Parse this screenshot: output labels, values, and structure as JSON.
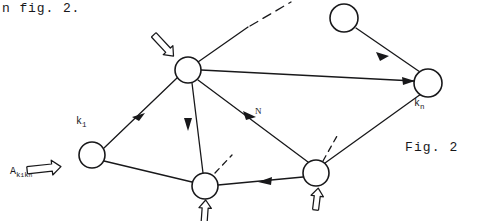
{
  "page": {
    "width": 477,
    "height": 221,
    "background": "#ffffff",
    "ink_color": "#18181a"
  },
  "text": {
    "top_caption": "n fig. 2.",
    "figure_caption": "Fig. 2",
    "node_label_k1": "k",
    "node_label_k1_sub": "1",
    "node_label_kn": "k",
    "node_label_kn_sub": "n",
    "edge_label_N": "N",
    "operator_label_A": "A",
    "operator_label_A_sub_k": "k",
    "operator_label_A_sub_k_1": "1",
    "operator_label_A_sub_k2": "k",
    "operator_label_A_sub_k2_n": "n"
  },
  "diagram": {
    "type": "directed-graph",
    "nodes": [
      {
        "id": "top",
        "name": "top-node",
        "cx": 188,
        "cy": 70,
        "r": 13,
        "label": ""
      },
      {
        "id": "k1",
        "name": "node-k1",
        "cx": 92,
        "cy": 155,
        "r": 13,
        "label": "k1"
      },
      {
        "id": "bl",
        "name": "bottom-left-node",
        "cx": 205,
        "cy": 186,
        "r": 13,
        "label": ""
      },
      {
        "id": "br",
        "name": "bottom-right-node",
        "cx": 316,
        "cy": 173,
        "r": 13,
        "label": ""
      },
      {
        "id": "tr",
        "name": "top-right-node",
        "cx": 344,
        "cy": 18,
        "r": 14,
        "label": ""
      },
      {
        "id": "kn",
        "name": "node-kn",
        "cx": 428,
        "cy": 83,
        "r": 14,
        "label": "kn"
      }
    ],
    "edges": [
      {
        "from": "k1",
        "to": "top",
        "arrow": "mid",
        "style": "solid"
      },
      {
        "from": "top",
        "to": "kn",
        "arrow": "end",
        "style": "solid"
      },
      {
        "from": "tr",
        "to": "kn",
        "arrow": "mid",
        "style": "solid"
      },
      {
        "from": "top",
        "to": "bl",
        "arrow": "mid",
        "style": "solid"
      },
      {
        "from": "top",
        "to": "br",
        "arrow": "mid",
        "style": "solid",
        "label": "N"
      },
      {
        "from": "br",
        "to": "bl",
        "arrow": "mid",
        "style": "solid"
      },
      {
        "from": "br",
        "to": "kn",
        "arrow": "none",
        "style": "solid"
      },
      {
        "from": "k1",
        "to": "bl",
        "arrow": "none",
        "style": "solid"
      },
      {
        "from": "top",
        "to": "upper-right-open",
        "arrow": "none",
        "style": "solid-to-dashed"
      },
      {
        "from": "bl",
        "to": "stub-upper-right",
        "arrow": "none",
        "style": "dashed"
      },
      {
        "from": "br",
        "to": "stub-upper-right",
        "arrow": "none",
        "style": "dashed"
      }
    ],
    "double_arrows": [
      {
        "name": "double-arrow-into-top-node",
        "target": "top",
        "direction": "down-right"
      },
      {
        "name": "double-arrow-operator-A",
        "target": "k1",
        "direction": "right"
      },
      {
        "name": "double-arrow-into-bottom-left-node",
        "target": "bl",
        "direction": "up"
      },
      {
        "name": "double-arrow-into-bottom-right-node",
        "target": "br",
        "direction": "up"
      }
    ]
  }
}
